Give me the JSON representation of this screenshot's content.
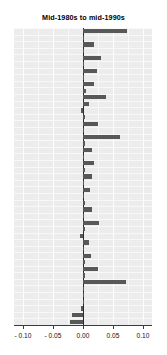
{
  "chart_data": {
    "type": "bar",
    "orientation": "horizontal",
    "title": "Mid-1980s to mid-1990s",
    "xlabel": "",
    "ylabel": "",
    "xlim": [
      -0.115,
      0.115
    ],
    "xticks": [
      -0.1,
      -0.05,
      0.0,
      0.05,
      0.1
    ],
    "xticklabels": [
      "- 0.10",
      "- 0.05",
      "0.00",
      "0.05",
      "0.10"
    ],
    "grid": true,
    "legend": false,
    "bar_color": "#585858",
    "plot_background": "#ececec",
    "gridline_color": "#f8f8f8",
    "zero_line_color": "#2b2b2b",
    "categories": [
      "c1",
      "c2",
      "c3",
      "c4",
      "c5",
      "c6",
      "c7",
      "c8",
      "c9",
      "c10",
      "c11",
      "c12",
      "c13",
      "c14",
      "c15",
      "c16",
      "c17",
      "c18",
      "c19",
      "c20",
      "c21",
      "c22",
      "c23",
      "c24",
      "c25",
      "c26",
      "c27",
      "c28",
      "c29",
      "c30",
      "c31",
      "c32",
      "c33",
      "c34",
      "c35",
      "c36",
      "c37",
      "c38",
      "c39",
      "c40",
      "c41",
      "c42",
      "c43",
      "c44",
      "c45"
    ],
    "values": [
      0.0735,
      0.0005,
      0.0175,
      0.0015,
      0.03,
      0.001,
      0.0225,
      0.002,
      0.0175,
      0.0055,
      0.0385,
      0.01,
      -0.004,
      0.0025,
      0.025,
      0.0015,
      0.0615,
      0.003,
      0.0145,
      0.002,
      0.018,
      0.003,
      0.015,
      0.002,
      0.012,
      0.0015,
      0.003,
      0.015,
      0.002,
      0.027,
      0.0025,
      -0.005,
      0.0095,
      0.002,
      0.0125,
      0.003,
      0.025,
      0.003,
      0.072,
      0.0015,
      0.002,
      0.001,
      -0.004,
      -0.0185,
      -0.0225
    ]
  }
}
